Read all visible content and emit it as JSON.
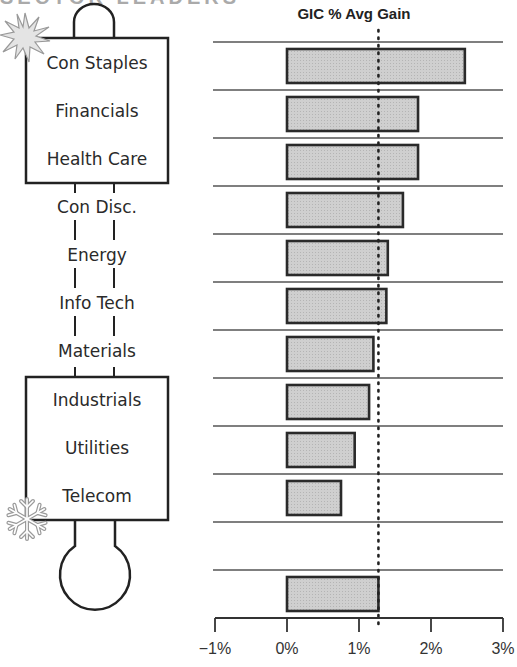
{
  "header": {
    "cut_heading": "SECTOR LEADERS"
  },
  "thermometer": {
    "hot_icon": "starburst-icon",
    "cold_icon": "snowflake-icon",
    "hot_group": [
      "Con Staples",
      "Financials",
      "Health Care"
    ],
    "middle_group": [
      "Con Disc.",
      "Energy",
      "Info Tech",
      "Materials"
    ],
    "cold_group": [
      "Industrials",
      "Utilities",
      "Telecom"
    ]
  },
  "chart_data": {
    "type": "bar",
    "orientation": "horizontal",
    "title": "GIC % Avg Gain",
    "xlabel": "",
    "ylabel": "",
    "categories": [
      "Con Staples",
      "Financials",
      "Health Care",
      "Con Disc.",
      "Energy",
      "Info Tech",
      "Materials",
      "Industrials",
      "Utilities",
      "Telecom",
      "",
      "Average"
    ],
    "values": [
      2.47,
      1.82,
      1.82,
      1.61,
      1.4,
      1.38,
      1.2,
      1.14,
      0.94,
      0.75,
      null,
      1.27
    ],
    "xlim": [
      -1,
      3
    ],
    "x_ticks": [
      "-1%",
      "0%",
      "1%",
      "2%",
      "3%"
    ],
    "reference_line": {
      "value": 1.27,
      "style": "dotted",
      "label": "average"
    },
    "grid": "horizontal separators between rows",
    "bar_color": "#c8c8c8",
    "bar_edge_color": "#2a2a2a",
    "legend": null
  }
}
